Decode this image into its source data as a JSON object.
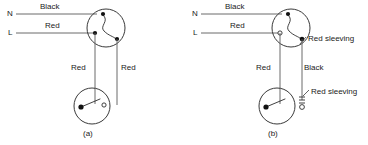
{
  "figure": {
    "background_color": "#ffffff",
    "line_color": "#3a3a3a",
    "text_color": "#1a1a1a"
  },
  "diagram_a": {
    "caption": "(a)",
    "supply": {
      "neutral_terminal_label": "N",
      "neutral_wire_label": "Black",
      "live_terminal_label": "L",
      "live_wire_label": "Red"
    },
    "strapper_wires": {
      "left_label": "Red",
      "right_label": "Red"
    },
    "top_switch": {
      "name": "two-way-switch-top",
      "terminals": [
        "common-filled",
        "l1-filled",
        "l2-filled"
      ]
    },
    "bottom_switch": {
      "name": "two-way-switch-bottom",
      "terminals": [
        "common-filled",
        "l1-hollow"
      ]
    }
  },
  "diagram_b": {
    "caption": "(b)",
    "supply": {
      "neutral_terminal_label": "N",
      "neutral_wire_label": "Black",
      "live_terminal_label": "L",
      "live_wire_label": "Red"
    },
    "strapper_wires": {
      "left_label": "Red",
      "right_label": "Black"
    },
    "annotations": {
      "top_sleeving_label": "Red sleeving",
      "bottom_sleeving_label": "Red sleeving"
    },
    "top_switch": {
      "name": "two-way-switch-top",
      "terminals": [
        "common-filled",
        "l1-hollow",
        "l2-filled"
      ]
    },
    "bottom_switch": {
      "name": "two-way-switch-bottom",
      "terminals": [
        "common-filled",
        "l1-hollow"
      ]
    }
  }
}
